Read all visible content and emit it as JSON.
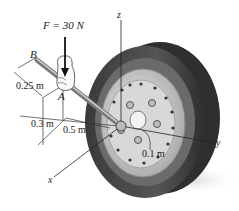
{
  "figure": {
    "force_label": "F = 30 N",
    "point_b": "B",
    "point_a": "A",
    "axis_x": "x",
    "axis_y": "y",
    "axis_z": "z",
    "dim_025": "0.25 m",
    "dim_03": "0.3 m",
    "dim_05": "0.5 m",
    "dim_01": "0.1 m"
  },
  "colors": {
    "tire": "#4a4a4a",
    "tire_tread": "#5c5c5c",
    "rim": "#cfcfcf",
    "hub": "#e2e2e2",
    "wrench": "#9a9a9a",
    "line": "#222222",
    "shadow": "#d9d9d9"
  }
}
